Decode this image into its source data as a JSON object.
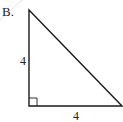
{
  "figure": {
    "option_label": "B.",
    "shape": "right-triangle",
    "vertical_side_label": "4",
    "horizontal_side_label": "4",
    "right_angle_marker": true,
    "colors": {
      "stroke": "#1a1a1a",
      "text": "#222222",
      "background": "#ffffff",
      "artifact_line": "#d8d8d8"
    }
  }
}
